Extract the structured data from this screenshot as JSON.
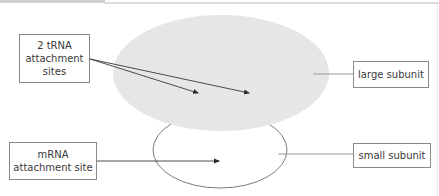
{
  "diagram": {
    "labels": {
      "trna": "2 tRNA attachment sites",
      "mrna": "mRNA attachment site",
      "large_subunit": "large subunit",
      "small_subunit": "small subunit"
    },
    "colors": {
      "large_subunit_fill": "#e6e6e6",
      "small_subunit_stroke": "#7a7a7a",
      "arrow": "#3a3a3a",
      "leader_line": "#9a9a9a",
      "box_border": "#8a8a8a"
    }
  }
}
